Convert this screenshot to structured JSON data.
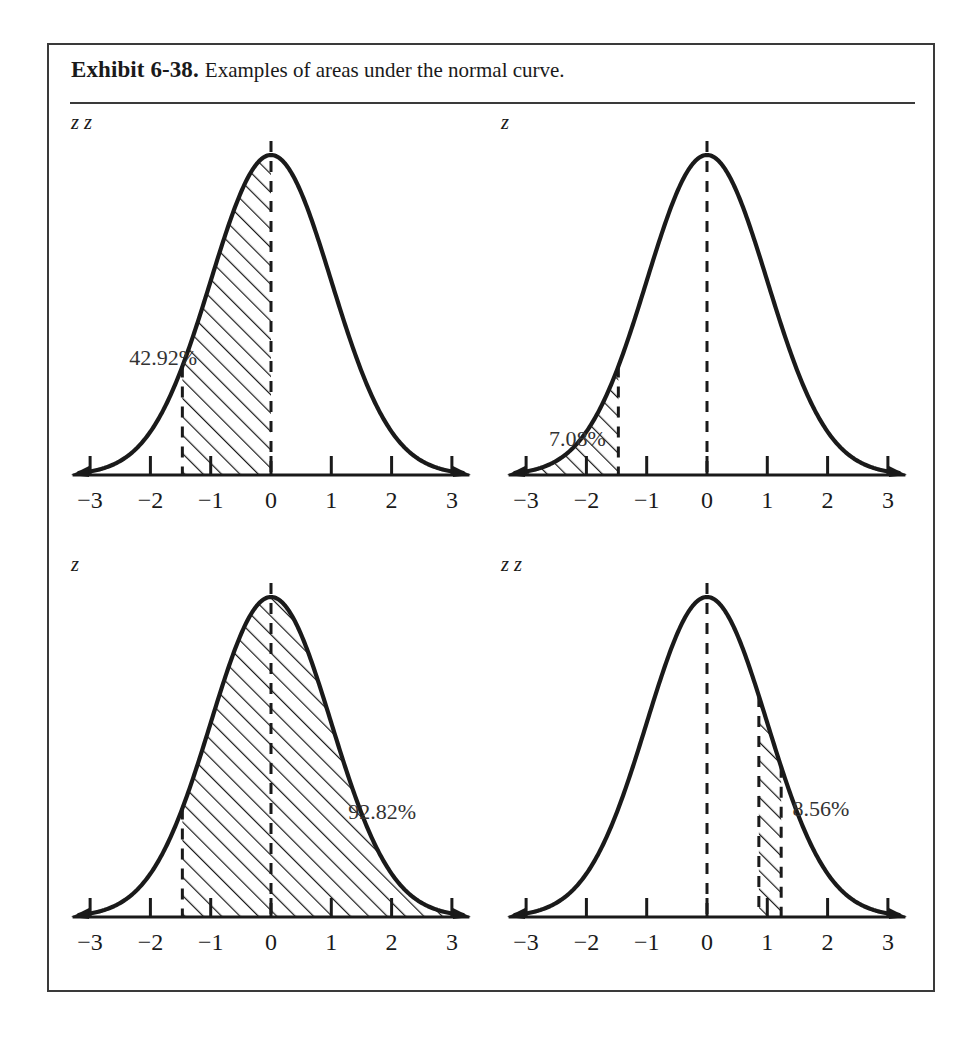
{
  "exhibit": {
    "label": "Exhibit 6-38.",
    "caption": "Examples of areas under the normal curve."
  },
  "axis": {
    "tick_labels": [
      "−3",
      "−2",
      "−1",
      "0",
      "1",
      "2",
      "3"
    ],
    "ticks": [
      -3,
      -2,
      -1,
      0,
      1,
      2,
      3
    ],
    "xmin": -3.35,
    "xmax": 3.35
  },
  "panels": [
    {
      "id": "panel-a",
      "heading_prefix": "A.",
      "heading_body": "Area between",
      "heading_eq1": "= 0",
      "heading_and": "and",
      "heading_eq2": "= −1.47",
      "heading_full": "A. Area between z = 0 and z = −1.47",
      "percent": "42.92%",
      "percent_x": -2.35,
      "percent_y": 0.345,
      "shade_from": -1.47,
      "shade_to": 0,
      "dashed_lines": [
        -1.47,
        0
      ],
      "center_dashed": 0
    },
    {
      "id": "panel-b",
      "heading_prefix": "B.",
      "heading_body": "Area to the left of",
      "heading_eq1": "= −1.47",
      "heading_and": "",
      "heading_eq2": "",
      "heading_full": "B. Area to the left of z = −1.47",
      "percent": "7.08%",
      "percent_x": -2.62,
      "percent_y": 0.092,
      "shade_from": -3.15,
      "shade_to": -1.47,
      "dashed_lines": [
        -1.47
      ],
      "center_dashed": 0
    },
    {
      "id": "panel-c",
      "heading_prefix": "C.",
      "heading_body": "Area to the right of",
      "heading_eq1": "= −1.47",
      "heading_and": "",
      "heading_eq2": "",
      "heading_full": "C. Area to the right of z = −1.47",
      "percent": "92.82%",
      "percent_x": 1.28,
      "percent_y": 0.305,
      "shade_from": -1.47,
      "shade_to": 3.15,
      "dashed_lines": [
        -1.47
      ],
      "center_dashed": 0
    },
    {
      "id": "panel-d",
      "heading_prefix": "D.",
      "heading_body": "Area between",
      "heading_eq1": "= 0.86",
      "heading_and": "and",
      "heading_eq2": "= 1.23",
      "heading_full": "D. Area between z = 0.86 and z = 1.23",
      "percent": "8.56%",
      "percent_x": 1.42,
      "percent_y": 0.315,
      "shade_from": 0.86,
      "shade_to": 1.23,
      "dashed_lines": [
        0.86,
        1.23
      ],
      "center_dashed": 0
    }
  ],
  "chart_data": {
    "type": "area",
    "title": "Examples of areas under the normal curve",
    "xlabel": "z",
    "ylabel": "",
    "distribution": "standard normal",
    "mean": 0,
    "sd": 1,
    "xlim": [
      -3,
      3
    ],
    "grid": false,
    "legend": "none",
    "xticks": [
      -3,
      -2,
      -1,
      0,
      1,
      2,
      3
    ],
    "xticklabels": [
      "−3",
      "−2",
      "−1",
      "0",
      "1",
      "2",
      "3"
    ],
    "series": [
      {
        "name": "A. Area between z = 0 and z = -1.47",
        "shaded_interval": [
          -1.47,
          0
        ],
        "area_percent": 42.92
      },
      {
        "name": "B. Area to the left of z = -1.47",
        "shaded_interval": [
          null,
          -1.47
        ],
        "area_percent": 7.08
      },
      {
        "name": "C. Area to the right of z = -1.47",
        "shaded_interval": [
          -1.47,
          null
        ],
        "area_percent": 92.82
      },
      {
        "name": "D. Area between z = 0.86 and z = 1.23",
        "shaded_interval": [
          0.86,
          1.23
        ],
        "area_percent": 8.56
      }
    ]
  }
}
